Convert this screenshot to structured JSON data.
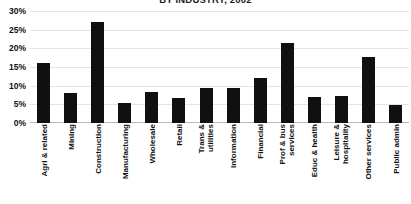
{
  "chart_data": {
    "type": "bar",
    "title": "BY INDUSTRY, 2002",
    "xlabel": "",
    "ylabel": "",
    "ylim": [
      0,
      30
    ],
    "ytick_labels": [
      "30%",
      "25%",
      "20%",
      "15%",
      "10%",
      "5%",
      "0%"
    ],
    "ytick_values": [
      30,
      25,
      20,
      15,
      10,
      5,
      0
    ],
    "grid": true,
    "legend": false,
    "bar_color": "#101010",
    "categories": [
      "Agri & related",
      "Mining",
      "Construction",
      "Manufacturing",
      "Wholesale",
      "Retail",
      "Trans &\nutilities",
      "Information",
      "Financial",
      "Prof & bus\nservices",
      "Educ & health",
      "Leisure &\nhospitality",
      "Other services",
      "Public admin"
    ],
    "values": [
      16.0,
      8.0,
      27.0,
      5.4,
      8.2,
      6.7,
      9.5,
      9.5,
      12.0,
      21.3,
      7.0,
      7.2,
      17.8,
      4.8
    ]
  }
}
